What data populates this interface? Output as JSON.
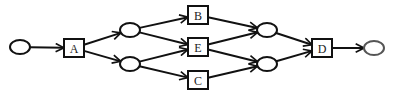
{
  "diagram": {
    "type": "petri-net",
    "places": [
      {
        "id": "p_start",
        "role": "start"
      },
      {
        "id": "p1",
        "role": "internal"
      },
      {
        "id": "p2",
        "role": "internal"
      },
      {
        "id": "p3",
        "role": "internal"
      },
      {
        "id": "p4",
        "role": "internal"
      },
      {
        "id": "p_end",
        "role": "end"
      }
    ],
    "transitions": [
      {
        "id": "A",
        "label": "A"
      },
      {
        "id": "B",
        "label": "B"
      },
      {
        "id": "E",
        "label": "E"
      },
      {
        "id": "C",
        "label": "C"
      },
      {
        "id": "D",
        "label": "D"
      }
    ],
    "arcs": [
      {
        "from": "p_start",
        "to": "A"
      },
      {
        "from": "A",
        "to": "p1"
      },
      {
        "from": "A",
        "to": "p2"
      },
      {
        "from": "p1",
        "to": "B"
      },
      {
        "from": "p1",
        "to": "E"
      },
      {
        "from": "p2",
        "to": "E"
      },
      {
        "from": "p2",
        "to": "C"
      },
      {
        "from": "B",
        "to": "p3"
      },
      {
        "from": "E",
        "to": "p3"
      },
      {
        "from": "E",
        "to": "p4"
      },
      {
        "from": "C",
        "to": "p4"
      },
      {
        "from": "p3",
        "to": "D"
      },
      {
        "from": "p4",
        "to": "D"
      },
      {
        "from": "D",
        "to": "p_end"
      }
    ]
  }
}
